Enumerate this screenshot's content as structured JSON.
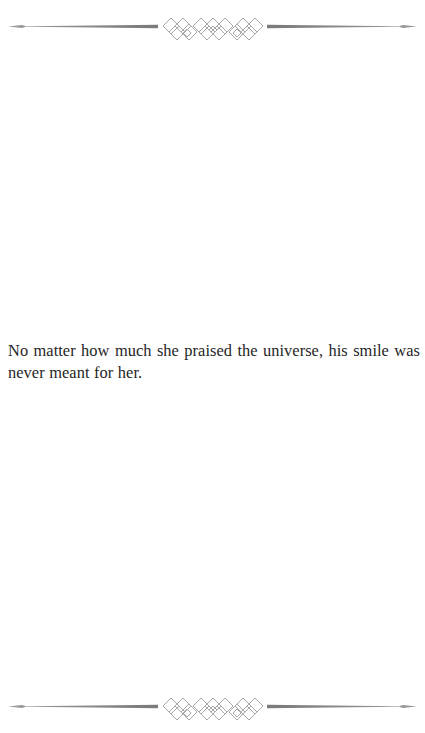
{
  "page": {
    "background": "#ffffff",
    "text_color": "#262626",
    "ornament_color": "#808080"
  },
  "dividers": {
    "top": {
      "icon": "ornamental-lattice-divider"
    },
    "bottom": {
      "icon": "ornamental-lattice-divider"
    }
  },
  "content": {
    "paragraphs": [
      "No matter how much she praised the universe, his smile was never meant for her."
    ]
  }
}
